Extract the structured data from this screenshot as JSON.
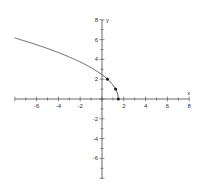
{
  "chart_data": {
    "type": "line",
    "title": "",
    "xlabel": "x",
    "ylabel": "y",
    "xlim": [
      -8,
      8
    ],
    "ylim": [
      -8,
      8
    ],
    "grid": false,
    "x_tick_labels": [
      "-6",
      "-4",
      "-2",
      "2",
      "4",
      "6",
      "8"
    ],
    "y_tick_labels": [
      "8",
      "6",
      "4",
      "2",
      "-2",
      "-4",
      "-6"
    ],
    "function": "y = 2*sqrt(1.5 - x)",
    "series": [
      {
        "name": "curve",
        "x": [
          -8,
          -6,
          -4,
          -2,
          0,
          0.5,
          1,
          1.25,
          1.5
        ],
        "y": [
          6.16,
          5.48,
          4.69,
          3.74,
          2.45,
          2.0,
          1.41,
          1.0,
          0
        ]
      }
    ],
    "marked_points": [
      {
        "x": 0.5,
        "y": 2
      },
      {
        "x": 1.25,
        "y": 1
      },
      {
        "x": 1.5,
        "y": 0
      }
    ]
  }
}
